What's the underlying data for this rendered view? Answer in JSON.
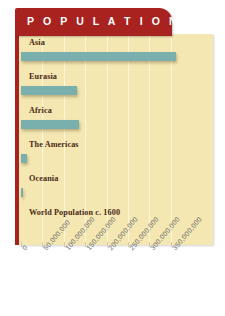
{
  "banner": {
    "title": "P O P U L A T I O N"
  },
  "colors": {
    "banner_red": "#a8231f",
    "panel_cream": "#f4e7b2",
    "bar_teal": "#79b0ad",
    "gridline": "#fdf8e0",
    "label_brown": "#4a2a15",
    "tick_gray": "#6f6f6f"
  },
  "chart_data": {
    "type": "bar",
    "orientation": "horizontal",
    "title": "P O P U L A T I O N",
    "xlabel": "",
    "ylabel": "",
    "categories": [
      "Asia",
      "Eurasia",
      "Africa",
      "The Americas",
      "Oceania",
      "World Population c. 1600"
    ],
    "values": [
      362000000,
      130000000,
      135000000,
      13000000,
      5000000,
      0
    ],
    "xlim": [
      0,
      400000000
    ],
    "xticks": [
      0,
      50000000,
      100000000,
      150000000,
      200000000,
      250000000,
      300000000,
      350000000
    ],
    "xtick_labels": [
      "0",
      "50,000,000",
      "100,000,000",
      "150,000,000",
      "200,000,000",
      "250,000,000",
      "300,000,000",
      "350,000,000"
    ],
    "grid": true,
    "grid_axis": "x",
    "legend": false
  }
}
